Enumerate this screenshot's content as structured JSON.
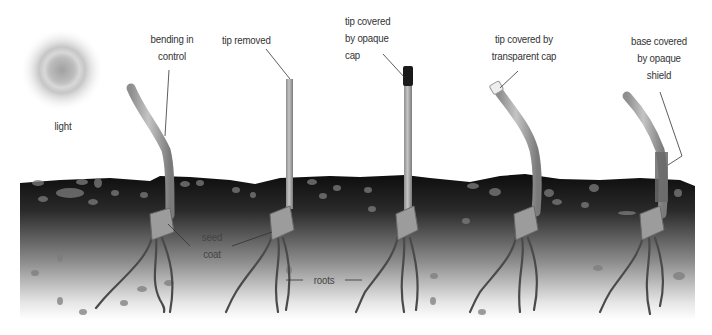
{
  "diagram": {
    "light_label": "light",
    "seedlings": [
      {
        "id": "control",
        "label": "bending in control",
        "label_lines": [
          "bending in",
          "control"
        ]
      },
      {
        "id": "tip-removed",
        "label": "tip removed",
        "label_lines": [
          "tip removed"
        ]
      },
      {
        "id": "opaque-cap",
        "label": "tip covered by opaque cap",
        "label_lines": [
          "tip covered",
          "by opaque",
          "cap"
        ]
      },
      {
        "id": "transparent-cap",
        "label": "tip covered by transparent cap",
        "label_lines": [
          "tip covered by",
          "transparent cap"
        ]
      },
      {
        "id": "opaque-shield",
        "label": "base covered by opaque shield",
        "label_lines": [
          "base covered",
          "by opaque",
          "shield"
        ]
      }
    ],
    "part_labels": {
      "seed_coat": [
        "seed",
        "coat"
      ],
      "roots": "roots"
    },
    "colors": {
      "soil_top": "#111111",
      "soil_bottom": "#ffffff",
      "stem": "#a8a8a8",
      "cap_opaque": "#1a1a1a",
      "cap_transparent": "#e8e8e8",
      "light_center": "#9a9a9a"
    }
  }
}
